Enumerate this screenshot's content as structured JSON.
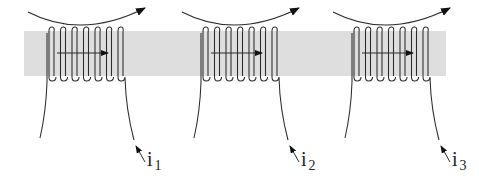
{
  "figure": {
    "band": {
      "x": 24,
      "y": 31,
      "width": 422,
      "height": 45,
      "color": "#dedede"
    },
    "stroke_color": "#2a2a2a",
    "coils": [
      {
        "id": "coil-1",
        "offset_x": 0,
        "current_label": "i",
        "current_subscript": "1"
      },
      {
        "id": "coil-2",
        "offset_x": 154,
        "current_label": "i",
        "current_subscript": "2"
      },
      {
        "id": "coil-3",
        "offset_x": 305,
        "current_label": "i",
        "current_subscript": "3"
      }
    ],
    "turns_per_coil": 7
  }
}
